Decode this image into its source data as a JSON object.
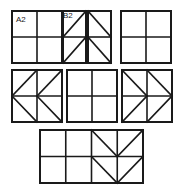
{
  "figure": {
    "title": "",
    "background_color": "#ffffff",
    "line_color": "#1a1a1a",
    "outer_stroke_width": 2.0,
    "inner_stroke_width": 1.6,
    "diagonal_stroke_width": 1.6
  },
  "labels": [
    {
      "id": "A2",
      "text": "A2",
      "x": 16,
      "y": 16,
      "belongs_to_panel": "panel-1"
    },
    {
      "id": "B2",
      "text": "B2",
      "x": 63,
      "y": 12,
      "belongs_to_panel": "panel-2"
    }
  ],
  "panels": [
    {
      "name": "panel-1",
      "label": "A2",
      "x": 12,
      "y": 11,
      "width": 50,
      "height": 52,
      "cols": 2,
      "rows": 2,
      "diagonals": [],
      "description": "plain 2x2 grid"
    },
    {
      "name": "panel-2",
      "label": "B2",
      "x": 63,
      "y": 11,
      "width": 23,
      "height": 52,
      "cols": 1,
      "rows": 2,
      "diagonals": [
        {
          "cell_col": 0,
          "cell_row": 0,
          "direction": "bl-tr"
        },
        {
          "cell_col": 0,
          "cell_row": 1,
          "direction": "bl-tr"
        }
      ],
      "description": "1x2 grid, each cell diagonal bottom-left to top-right"
    },
    {
      "name": "panel-3",
      "label": "",
      "x": 88,
      "y": 11,
      "width": 23,
      "height": 52,
      "cols": 1,
      "rows": 2,
      "diagonals": [
        {
          "cell_col": 0,
          "cell_row": 0,
          "direction": "tl-br"
        },
        {
          "cell_col": 0,
          "cell_row": 1,
          "direction": "tl-br"
        }
      ],
      "description": "1x2 grid, each cell diagonal top-left to bottom-right"
    },
    {
      "name": "panel-4",
      "label": "",
      "x": 121,
      "y": 11,
      "width": 50,
      "height": 52,
      "cols": 2,
      "rows": 2,
      "diagonals": [],
      "description": "plain 2x2 grid"
    },
    {
      "name": "panel-5",
      "label": "",
      "x": 12,
      "y": 70,
      "width": 50,
      "height": 52,
      "cols": 2,
      "rows": 2,
      "diagonals": [
        {
          "cell_col": 0,
          "cell_row": 0,
          "direction": "bl-tr"
        },
        {
          "cell_col": 0,
          "cell_row": 1,
          "direction": "tl-br"
        },
        {
          "cell_col": 1,
          "cell_row": 0,
          "direction": "bl-tr"
        },
        {
          "cell_col": 1,
          "cell_row": 1,
          "direction": "tl-br"
        }
      ],
      "description": "2x2 grid, left-pointing chevrons in both columns"
    },
    {
      "name": "panel-6",
      "label": "",
      "x": 67,
      "y": 70,
      "width": 50,
      "height": 52,
      "cols": 2,
      "rows": 2,
      "diagonals": [],
      "description": "plain 2x2 grid"
    },
    {
      "name": "panel-7",
      "label": "",
      "x": 122,
      "y": 70,
      "width": 50,
      "height": 52,
      "cols": 2,
      "rows": 2,
      "diagonals": [
        {
          "cell_col": 0,
          "cell_row": 0,
          "direction": "tl-br"
        },
        {
          "cell_col": 0,
          "cell_row": 1,
          "direction": "bl-tr"
        },
        {
          "cell_col": 1,
          "cell_row": 0,
          "direction": "tl-br"
        },
        {
          "cell_col": 1,
          "cell_row": 1,
          "direction": "bl-tr"
        }
      ],
      "description": "2x2 grid, right-pointing chevrons in both columns"
    },
    {
      "name": "panel-8",
      "label": "",
      "x": 40,
      "y": 130,
      "width": 103,
      "height": 53,
      "cols": 4,
      "rows": 2,
      "diagonals": [
        {
          "cell_col": 2,
          "cell_row": 0,
          "direction": "tl-br"
        },
        {
          "cell_col": 3,
          "cell_row": 0,
          "direction": "bl-tr"
        },
        {
          "cell_col": 2,
          "cell_row": 1,
          "direction": "tl-br"
        },
        {
          "cell_col": 3,
          "cell_row": 1,
          "direction": "bl-tr"
        }
      ],
      "description": "4x2 wide grid with downward V chevrons in columns 3 and 4"
    }
  ]
}
